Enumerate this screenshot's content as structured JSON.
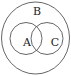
{
  "diagram": {
    "type": "venn",
    "sets": [
      {
        "id": "B",
        "label": "B",
        "role": "universal/outer set"
      },
      {
        "id": "A",
        "label": "A",
        "role": "subset of B, overlaps C"
      },
      {
        "id": "C",
        "label": "C",
        "role": "subset of B, overlaps A"
      }
    ],
    "stroke_color": "#444444",
    "background": "#ffffff"
  }
}
